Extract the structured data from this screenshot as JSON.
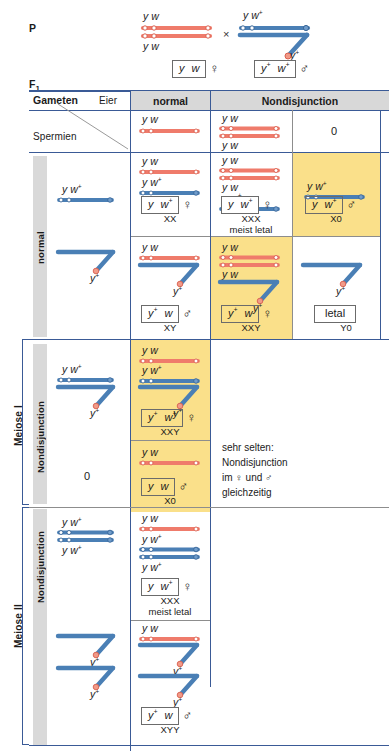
{
  "figure": {
    "language": "de",
    "title_p": "P",
    "title_f1": "F",
    "title_f1_sub": "1",
    "cross_symbol": "×",
    "colors": {
      "x_chromosome": "#ef7b6b",
      "y_chromosome": "#4a7fb5",
      "highlight": "#fae08a",
      "grid": "#3a5a96",
      "header_fill": "#d8d8d8",
      "grey_bar": "#d9d9d9"
    }
  },
  "parents": {
    "mother": {
      "top_label": "y w",
      "bottom_label": "y w",
      "gamete_box": [
        "y",
        "w"
      ],
      "sex_symbol": "♀"
    },
    "father": {
      "top_label": "y w+",
      "y_label": "y+",
      "gamete_box": [
        "y+",
        "w+"
      ],
      "sex_symbol": "♂"
    }
  },
  "table": {
    "corner_row1_left": "Gameten",
    "corner_row1_right": "Eier",
    "corner_row2_left": "Spermien",
    "columns": [
      {
        "label": "normal"
      },
      {
        "label": "Nondisjunction"
      }
    ],
    "egg_header_row": {
      "normal": {
        "label": "y w"
      },
      "nondisjunction": {
        "top": "y w",
        "bottom": "y w"
      },
      "nullo": "0"
    },
    "row_groups": [
      {
        "name": "normal",
        "vertical_label": "normal",
        "rows": [
          {
            "sperm": {
              "label": "y w+",
              "type": "x"
            },
            "cells": [
              {
                "column": "normal",
                "highlight": false,
                "chromosomes": [
                  {
                    "type": "x",
                    "label": "y w"
                  },
                  {
                    "type": "x-blue",
                    "label": "y w+"
                  }
                ],
                "result_box": [
                  "y",
                  "w+"
                ],
                "sex_symbol": "♀",
                "karyotype": "XX",
                "note": ""
              },
              {
                "column": "nondisjunction",
                "highlight": false,
                "chromosomes": [
                  {
                    "type": "x",
                    "label": "y w"
                  },
                  {
                    "type": "x",
                    "label": "y w"
                  },
                  {
                    "type": "x-blue",
                    "label": "y w+"
                  }
                ],
                "result_box": [
                  "y",
                  "w+"
                ],
                "sex_symbol": "♀",
                "karyotype": "XXX",
                "note": "meist letal"
              },
              {
                "column": "nullo",
                "highlight": true,
                "chromosomes": [
                  {
                    "type": "x-blue",
                    "label": "y w+"
                  }
                ],
                "result_box": [
                  "y",
                  "w+"
                ],
                "sex_symbol": "♂",
                "karyotype": "X0",
                "note": ""
              }
            ]
          },
          {
            "sperm": {
              "label": "",
              "type": "y"
            },
            "cells": [
              {
                "column": "normal",
                "highlight": false,
                "chromosomes": [
                  {
                    "type": "x",
                    "label": "y w"
                  },
                  {
                    "type": "y",
                    "label": "y+"
                  }
                ],
                "result_box": [
                  "y+",
                  "w"
                ],
                "sex_symbol": "♂",
                "karyotype": "XY",
                "note": ""
              },
              {
                "column": "nondisjunction",
                "highlight": true,
                "chromosomes": [
                  {
                    "type": "x",
                    "label": "y w"
                  },
                  {
                    "type": "x",
                    "label": "y w"
                  },
                  {
                    "type": "y",
                    "label": "y+"
                  }
                ],
                "result_box": [
                  "y+",
                  "w"
                ],
                "sex_symbol": "♀",
                "karyotype": "XXY",
                "note": ""
              },
              {
                "column": "nullo",
                "highlight": false,
                "chromosomes": [
                  {
                    "type": "y",
                    "label": "y+"
                  }
                ],
                "result_box": [
                  "letal"
                ],
                "sex_symbol": "",
                "karyotype": "Y0",
                "note": ""
              }
            ]
          }
        ]
      },
      {
        "name": "nondisjunction-meiose-1",
        "vertical_label": "Nondisjunction",
        "bracket_label": "Meiose I",
        "rows": [
          {
            "sperm": {
              "label": "y w+",
              "type": "xy"
            },
            "cells": [
              {
                "column": "normal",
                "highlight": true,
                "chromosomes": [
                  {
                    "type": "x",
                    "label": "y w"
                  },
                  {
                    "type": "x-blue",
                    "label": "y w+"
                  },
                  {
                    "type": "y",
                    "label": "y+"
                  }
                ],
                "result_box": [
                  "y+",
                  "w+"
                ],
                "sex_symbol": "♀",
                "karyotype": "XXY",
                "note": ""
              }
            ]
          },
          {
            "sperm": {
              "label": "0",
              "type": "zero"
            },
            "cells": [
              {
                "column": "normal",
                "highlight": true,
                "chromosomes": [
                  {
                    "type": "x",
                    "label": "y w"
                  }
                ],
                "result_box": [
                  "y",
                  "w"
                ],
                "sex_symbol": "♂",
                "karyotype": "X0",
                "note": ""
              }
            ]
          }
        ]
      },
      {
        "name": "nondisjunction-meiose-2",
        "vertical_label": "Nondisjunction",
        "bracket_label": "Meiose II",
        "rows": [
          {
            "sperm": {
              "label_top": "y w+",
              "label_bottom": "y w+",
              "type": "xx-blue"
            },
            "cells": [
              {
                "column": "normal",
                "highlight": false,
                "chromosomes": [
                  {
                    "type": "x",
                    "label": "y w"
                  },
                  {
                    "type": "x-blue",
                    "label": "y w+"
                  },
                  {
                    "type": "x-blue",
                    "label": "y w+"
                  }
                ],
                "result_box": [
                  "y",
                  "w+"
                ],
                "sex_symbol": "♀",
                "karyotype": "XXX",
                "note": "meist letal"
              }
            ]
          },
          {
            "sperm": {
              "label": "",
              "type": "yy"
            },
            "cells": [
              {
                "column": "normal",
                "highlight": false,
                "chromosomes": [
                  {
                    "type": "x",
                    "label": "y w"
                  },
                  {
                    "type": "y",
                    "label": "y+"
                  },
                  {
                    "type": "y",
                    "label": "y+"
                  }
                ],
                "result_box": [
                  "y+",
                  "w"
                ],
                "sex_symbol": "♂",
                "karyotype": "XYY",
                "note": ""
              }
            ]
          }
        ]
      }
    ],
    "side_note": "sehr selten:\nNondisjunction\nim ♀  und ♂\ngleichzeitig"
  }
}
